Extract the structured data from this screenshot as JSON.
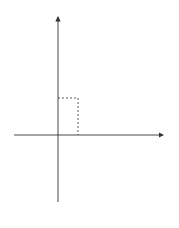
{
  "figure": {
    "caption": "图 11-8",
    "axes": {
      "x_label": "x",
      "y_label": "y",
      "origin_label": "O"
    },
    "curves": [
      {
        "name": "parabola-up",
        "equation": "x²=y",
        "label_base": "x",
        "label_exp": "2",
        "label_rest": "=y"
      },
      {
        "name": "parabola-right",
        "equation": "y²=8x",
        "label_base": "y",
        "label_exp": "2",
        "label_rest": "=8x"
      }
    ],
    "intersection": {
      "x": 2,
      "y": 4,
      "x_tick": "2",
      "y_tick": "4"
    },
    "shaded_region": "area between x²=y and y²=8x from x=0 to x=2",
    "colors": {
      "curve": "#222222",
      "shade": "#b8b8b8",
      "axis": "#333333"
    }
  }
}
